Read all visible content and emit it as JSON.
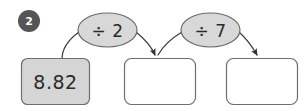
{
  "problem": {
    "number": "2",
    "badge_color": "#555555",
    "badge_text_color": "#ffffff"
  },
  "colors": {
    "filled_box_fill": "#d5d5d5",
    "empty_box_fill": "#ffffff",
    "box_stroke": "#6e6e6e",
    "ellipse_fill": "#d8d8d8",
    "ellipse_stroke": "#6b6b6b",
    "arrow_stroke": "#3a3a3a",
    "text_color": "#2b2b2b"
  },
  "chain": {
    "boxes": [
      {
        "value": "8.82",
        "filled": true,
        "name": "start-value-box"
      },
      {
        "value": "",
        "filled": false,
        "name": "answer-box-1"
      },
      {
        "value": "",
        "filled": false,
        "name": "answer-box-2"
      }
    ],
    "operations": [
      {
        "label": "÷ 2",
        "name": "operation-divide-by-2"
      },
      {
        "label": "÷ 7",
        "name": "operation-divide-by-7"
      }
    ]
  }
}
